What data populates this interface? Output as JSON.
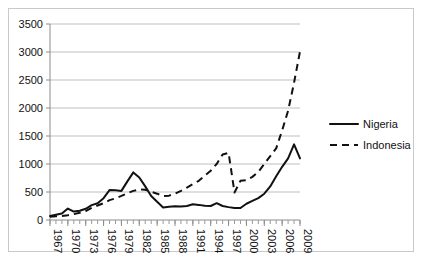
{
  "chart_data": {
    "type": "line",
    "title": "",
    "xlabel": "",
    "ylabel": "",
    "ylim": [
      0,
      3500
    ],
    "ytick_step": 500,
    "yticks": [
      0,
      500,
      1000,
      1500,
      2000,
      2500,
      3000,
      3500
    ],
    "ytick_labels": [
      "0",
      "500",
      "1000",
      "1500",
      "2000",
      "2500",
      "3000",
      "3500"
    ],
    "xlim": [
      1967,
      2009
    ],
    "x": [
      1967,
      1968,
      1969,
      1970,
      1971,
      1972,
      1973,
      1974,
      1975,
      1976,
      1977,
      1978,
      1979,
      1980,
      1981,
      1982,
      1983,
      1984,
      1985,
      1986,
      1987,
      1988,
      1989,
      1990,
      1991,
      1992,
      1993,
      1994,
      1995,
      1996,
      1997,
      1998,
      1999,
      2000,
      2001,
      2002,
      2003,
      2004,
      2005,
      2006,
      2007,
      2008,
      2009
    ],
    "xtick_labels": [
      "1967",
      "1970",
      "1973",
      "1976",
      "1979",
      "1982",
      "1985",
      "1988",
      "1991",
      "1994",
      "1997",
      "2000",
      "2003",
      "2006",
      "2009"
    ],
    "xtick_values": [
      1967,
      1970,
      1973,
      1976,
      1979,
      1982,
      1985,
      1988,
      1991,
      1994,
      1997,
      2000,
      2003,
      2006,
      2009
    ],
    "xtick_label_rotation": -90,
    "grid": "horizontal",
    "legend_position": "right",
    "series": [
      {
        "name": "Nigeria",
        "style": "solid",
        "color": "#111111",
        "values": [
          70,
          95,
          115,
          205,
          150,
          165,
          200,
          265,
          300,
          390,
          535,
          530,
          520,
          690,
          850,
          760,
          600,
          430,
          325,
          225,
          235,
          245,
          240,
          250,
          280,
          270,
          255,
          250,
          300,
          250,
          230,
          215,
          215,
          290,
          340,
          390,
          470,
          600,
          780,
          950,
          1100,
          1350,
          1100
        ]
      },
      {
        "name": "Indonesia",
        "style": "dashed",
        "color": "#111111",
        "values": [
          60,
          65,
          70,
          85,
          105,
          130,
          160,
          215,
          260,
          300,
          355,
          385,
          430,
          480,
          520,
          545,
          540,
          505,
          470,
          430,
          435,
          470,
          520,
          580,
          640,
          700,
          790,
          880,
          1000,
          1170,
          1200,
          490,
          700,
          710,
          770,
          860,
          1000,
          1140,
          1280,
          1600,
          1950,
          2450,
          3010
        ]
      }
    ],
    "legend": [
      {
        "label": "Nigeria",
        "style": "solid"
      },
      {
        "label": "Indonesia",
        "style": "dashed"
      }
    ]
  }
}
